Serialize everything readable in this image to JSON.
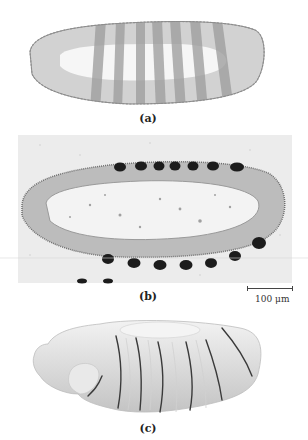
{
  "figure": {
    "panels": [
      {
        "id": "a",
        "label": "(a)",
        "description": "Drawing of embryo with seven transverse stripes"
      },
      {
        "id": "b",
        "label": "(b)",
        "description": "Micrograph of embryo section with periodic dark stained nuclei clusters"
      },
      {
        "id": "c",
        "label": "(c)",
        "description": "3D rendering of segmented embryo"
      }
    ],
    "scale_bar": {
      "text": "100 μm"
    },
    "colors": {
      "background": "#ffffff",
      "stripe_gray": "#a8a8a8",
      "body_gray": "#c9c9c9",
      "stain_dark": "#1a1a1a",
      "speckle_bg": "#e8e8e8",
      "segment_line": "#3a3a3a"
    }
  }
}
